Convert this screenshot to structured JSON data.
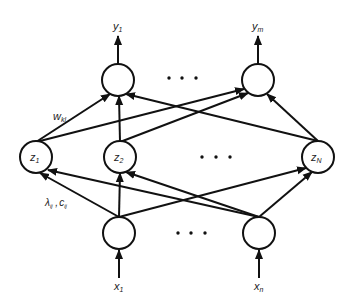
{
  "diagram": {
    "type": "neural-network",
    "labels": {
      "y1": "y",
      "y1_sub": "1",
      "ym": "y",
      "ym_sub": "m",
      "z1": "z",
      "z1_sub": "1",
      "z2": "z",
      "z2_sub": "2",
      "zN": "z",
      "zN_sub": "N",
      "x1": "x",
      "x1_sub": "1",
      "xn": "x",
      "xn_sub": "n",
      "w": "w",
      "w_sub": "kl",
      "lambda": "λ",
      "lambda_sub": "ij",
      "comma": " ,",
      "c": "c",
      "c_sub": "ij"
    },
    "layers": [
      {
        "name": "output",
        "nodes": [
          "y1",
          "ym"
        ],
        "ellipsis": true
      },
      {
        "name": "hidden",
        "nodes": [
          "z1",
          "z2",
          "zN"
        ],
        "ellipsis": true
      },
      {
        "name": "input",
        "nodes": [
          "x1",
          "xn"
        ],
        "ellipsis": true
      }
    ],
    "edges": [
      [
        "z1",
        "y1"
      ],
      [
        "z1",
        "ym"
      ],
      [
        "z2",
        "y1"
      ],
      [
        "z2",
        "ym"
      ],
      [
        "zN",
        "y1"
      ],
      [
        "zN",
        "ym"
      ],
      [
        "x1",
        "z1"
      ],
      [
        "x1",
        "z2"
      ],
      [
        "x1",
        "zN"
      ],
      [
        "xn",
        "z1"
      ],
      [
        "xn",
        "z2"
      ],
      [
        "xn",
        "zN"
      ]
    ],
    "edge_labels": {
      "hidden_to_output": "w_kl",
      "input_to_hidden": "λ_ij , c_ij"
    },
    "colors": {
      "stroke": "#111111",
      "background": "#ffffff"
    }
  }
}
